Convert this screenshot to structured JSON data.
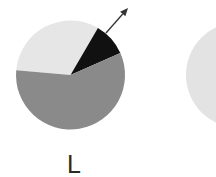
{
  "chart_data": [
    {
      "type": "pie",
      "title": "",
      "label": "L",
      "center": [
        70.5,
        75
      ],
      "radius": 54.5,
      "start_angle_deg": 175,
      "direction": "clockwise",
      "slices": [
        {
          "name": "light",
          "value": 32,
          "color": "#e6e6e6"
        },
        {
          "name": "black",
          "value": 10,
          "color": "#111111"
        },
        {
          "name": "gray",
          "value": 58,
          "color": "#8a8a8a"
        }
      ],
      "annotation": {
        "type": "arrow",
        "from": [
          106,
          33
        ],
        "to": [
          128,
          8
        ],
        "color": "#333333",
        "points_to": "black slice"
      }
    },
    {
      "type": "pie",
      "title": "",
      "label": "",
      "center": [
        239,
        75
      ],
      "radius": 53,
      "partially_visible": true,
      "slices": [
        {
          "name": "light",
          "value": 100,
          "color": "#e3e3e3"
        }
      ]
    }
  ],
  "labels": {
    "left_pie": "L"
  }
}
